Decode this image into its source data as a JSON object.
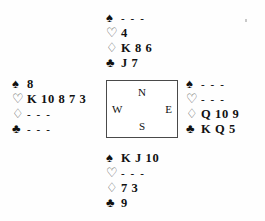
{
  "diagram": {
    "type": "bridge-deal",
    "void_marker": "- - -",
    "suit_symbols": {
      "spades": "♠",
      "hearts": "♡",
      "diamonds": "♢",
      "clubs": "♣"
    },
    "suit_order": [
      "spades",
      "hearts",
      "diamonds",
      "clubs"
    ],
    "colors": {
      "text": "#111111",
      "outline_suit": "#555555",
      "box_border": "#4a4a4a",
      "background": "#fefefe"
    }
  },
  "compass": {
    "north": "N",
    "south": "S",
    "west": "W",
    "east": "E"
  },
  "hands": {
    "north": {
      "label": "North",
      "spades": "- - -",
      "hearts": "4",
      "diamonds": "K 8 6",
      "clubs": "J 7"
    },
    "west": {
      "label": "West",
      "spades": "8",
      "hearts": "K 10 8 7 3",
      "diamonds": "- - -",
      "clubs": "- - -"
    },
    "east": {
      "label": "East",
      "spades": "- - -",
      "hearts": "- - -",
      "diamonds": "Q 10 9",
      "clubs": "K Q 5"
    },
    "south": {
      "label": "South",
      "spades": "K J 10",
      "hearts": "- - -",
      "diamonds": "7 3",
      "clubs": "9"
    }
  }
}
